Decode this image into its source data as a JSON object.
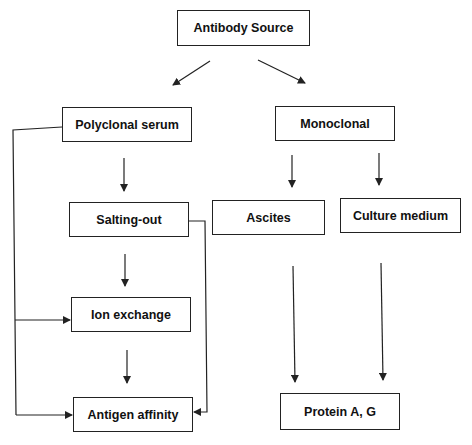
{
  "diagram": {
    "type": "flowchart",
    "nodes": {
      "root": "Antibody Source",
      "polyclonal": "Polyclonal serum",
      "monoclonal": "Monoclonal",
      "salting_out": "Salting-out",
      "ascites": "Ascites",
      "culture_medium": "Culture medium",
      "ion_exchange": "Ion exchange",
      "antigen_affinity": "Antigen affinity",
      "protein_ag": "Protein A, G"
    },
    "edges": [
      {
        "from": "Antibody Source",
        "to": "Polyclonal serum"
      },
      {
        "from": "Antibody Source",
        "to": "Monoclonal"
      },
      {
        "from": "Polyclonal serum",
        "to": "Salting-out"
      },
      {
        "from": "Polyclonal serum",
        "to": "Ion exchange"
      },
      {
        "from": "Polyclonal serum",
        "to": "Antigen affinity"
      },
      {
        "from": "Salting-out",
        "to": "Ion exchange"
      },
      {
        "from": "Salting-out",
        "to": "Antigen affinity"
      },
      {
        "from": "Ion exchange",
        "to": "Antigen affinity"
      },
      {
        "from": "Monoclonal",
        "to": "Ascites"
      },
      {
        "from": "Monoclonal",
        "to": "Culture medium"
      },
      {
        "from": "Ascites",
        "to": "Protein A, G"
      },
      {
        "from": "Culture medium",
        "to": "Protein A, G"
      }
    ],
    "colors": {
      "line": "#222222",
      "box_fill": "#ffffff",
      "text": "#111111"
    }
  }
}
